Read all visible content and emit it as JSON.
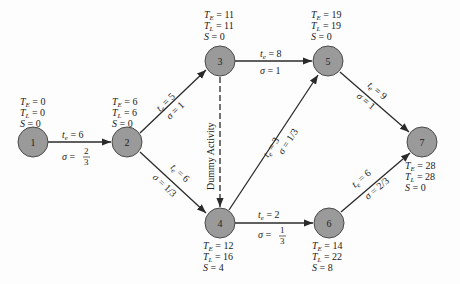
{
  "diagram": {
    "type": "PERT network",
    "node_fill": "#9a9a9a",
    "edge_color": "#2a2a2a",
    "nodes": [
      {
        "id": "1",
        "TE": "0",
        "TL": "0",
        "S": "0"
      },
      {
        "id": "2",
        "TE": "6",
        "TL": "6",
        "S": "0"
      },
      {
        "id": "3",
        "TE": "11",
        "TL": "11",
        "S": "0"
      },
      {
        "id": "4",
        "TE": "12",
        "TL": "16",
        "S": "4"
      },
      {
        "id": "5",
        "TE": "19",
        "TL": "19",
        "S": "0"
      },
      {
        "id": "6",
        "TE": "14",
        "TL": "22",
        "S": "8"
      },
      {
        "id": "7",
        "TE": "28",
        "TL": "28",
        "S": "0"
      }
    ],
    "edges": [
      {
        "from": "1",
        "to": "2",
        "te": "t_e = 6",
        "sigma": "σ = 2/3"
      },
      {
        "from": "2",
        "to": "3",
        "te": "t_e = 5",
        "sigma": "σ = 1"
      },
      {
        "from": "2",
        "to": "4",
        "te": "t_e = 6",
        "sigma": "σ = 1/3"
      },
      {
        "from": "3",
        "to": "5",
        "te": "t_e = 8",
        "sigma": "σ = 1"
      },
      {
        "from": "3",
        "to": "4",
        "label": "Dummy Activity",
        "dashed": true
      },
      {
        "from": "4",
        "to": "5",
        "te": "t_e = 3",
        "sigma": "σ = 1/3"
      },
      {
        "from": "4",
        "to": "6",
        "te": "t_e = 2",
        "sigma": "σ = 1/3"
      },
      {
        "from": "5",
        "to": "7",
        "te": "t_e = 9",
        "sigma": "σ = 1"
      },
      {
        "from": "6",
        "to": "7",
        "te": "t_e = 6",
        "sigma": "σ = 2/3"
      }
    ]
  },
  "labels": {
    "n1": "1",
    "n2": "2",
    "n3": "3",
    "n4": "4",
    "n5": "5",
    "n6": "6",
    "n7": "7",
    "te_eq": "= ",
    "dummy": "Dummy Activity",
    "e12_te": "6",
    "e12_sig_num": "2",
    "e12_sig_den": "3",
    "e23_te": "5",
    "e23_sig": "1",
    "e24_te": "6",
    "e24_sig_num": "1",
    "e24_sig_den": "3",
    "e35_te": "8",
    "e35_sig": "1",
    "e45_te": "3",
    "e45_sig_num": "1",
    "e45_sig_den": "3",
    "e46_te": "2",
    "e46_sig_num": "1",
    "e46_sig_den": "3",
    "e57_te": "9",
    "e57_sig": "1",
    "e67_te": "6",
    "e67_sig_num": "2",
    "e67_sig_den": "3",
    "n1_TE": "0",
    "n1_TL": "0",
    "n1_S": "0",
    "n2_TE": "6",
    "n2_TL": "6",
    "n2_S": "0",
    "n3_TE": "11",
    "n3_TL": "11",
    "n3_S": "0",
    "n4_TE": "12",
    "n4_TL": "16",
    "n4_S": "4",
    "n5_TE": "19",
    "n5_TL": "19",
    "n5_S": "0",
    "n6_TE": "14",
    "n6_TL": "22",
    "n6_S": "8",
    "n7_TE": "28",
    "n7_TL": "28",
    "n7_S": "0"
  }
}
